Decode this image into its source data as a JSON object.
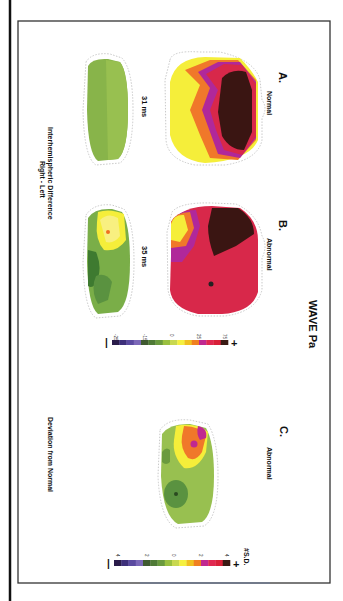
{
  "figure": {
    "title": "WAVE Pa",
    "panels": [
      {
        "label": "A.",
        "condition": "Normal",
        "top_map_time": "",
        "bottom_map_time": "31 ms"
      },
      {
        "label": "B.",
        "condition": "Abnormal",
        "top_map_time": "",
        "bottom_map_time": "35 ms"
      },
      {
        "label": "C.",
        "condition": "Abnormal",
        "caption": "Deviation from  Normal"
      }
    ],
    "row_caption_line1": "Interhemispheric Difference",
    "row_caption_line2": "Right - Left",
    "colorbar_amplitude": {
      "minus_symbol": "−",
      "plus_symbol": "+",
      "tick_labels": [
        "-25",
        "-15",
        "0",
        "25",
        "75"
      ],
      "colors": [
        "#2a1c4a",
        "#3d2f7a",
        "#5a4aa0",
        "#7b68b8",
        "#3f5a30",
        "#4f7a36",
        "#6a9a3e",
        "#9ac040",
        "#c8d850",
        "#f5f040",
        "#f0c020",
        "#f08020",
        "#c02890",
        "#e02850",
        "#d82038",
        "#3a1a14"
      ]
    },
    "colorbar_sd": {
      "unit_label": "#S.D.",
      "minus_symbol": "−",
      "plus_symbol": "+",
      "tick_labels": [
        "4",
        "2",
        "0",
        "2",
        "4"
      ],
      "colors": [
        "#2a1c4a",
        "#3d2f7a",
        "#5a4aa0",
        "#7b68b8",
        "#3f5a30",
        "#4f7a36",
        "#6a9a3e",
        "#9ac040",
        "#c8d850",
        "#f5f040",
        "#f0c020",
        "#f08020",
        "#c02890",
        "#e02850",
        "#d82038",
        "#3a1a14"
      ]
    },
    "map_colors": {
      "dark": "#3a1512",
      "red": "#d8284a",
      "magenta": "#b0289a",
      "orange": "#f0782a",
      "yellow": "#f5ee3a",
      "pale_yellow": "#f8f080",
      "green_light": "#98c050",
      "green_mid": "#7aae48",
      "green_dark": "#3e7a30",
      "outline": "#c8c8c8"
    }
  }
}
